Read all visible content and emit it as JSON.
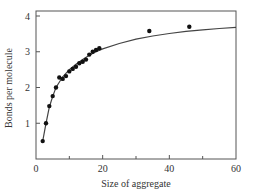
{
  "chart_data": {
    "type": "scatter",
    "title": "",
    "xlabel": "Size of aggregate",
    "ylabel": "Bonds per molecule",
    "xlim": [
      0,
      60
    ],
    "ylim": [
      0,
      4
    ],
    "x_ticks": [
      0,
      20,
      40,
      60
    ],
    "x_tick_labels": [
      "0",
      "20",
      "40",
      "60"
    ],
    "x_minor_ticks": [
      10,
      30,
      50
    ],
    "y_ticks": [
      1,
      2,
      3,
      4
    ],
    "y_tick_labels": [
      "1",
      "2",
      "3",
      "4"
    ],
    "grid": false,
    "legend": null,
    "series": [
      {
        "name": "data",
        "kind": "scatter",
        "marker": "filled-circle",
        "color": "#111111",
        "points": [
          [
            2,
            0.5
          ],
          [
            3,
            1.0
          ],
          [
            4,
            1.48
          ],
          [
            5,
            1.76
          ],
          [
            6,
            2.0
          ],
          [
            7,
            2.28
          ],
          [
            8,
            2.24
          ],
          [
            9,
            2.32
          ],
          [
            10,
            2.45
          ],
          [
            11,
            2.52
          ],
          [
            12,
            2.58
          ],
          [
            13,
            2.68
          ],
          [
            14,
            2.72
          ],
          [
            15,
            2.78
          ],
          [
            16,
            2.92
          ],
          [
            17,
            3.0
          ],
          [
            18,
            3.05
          ],
          [
            19,
            3.1
          ],
          [
            34,
            3.58
          ],
          [
            46,
            3.7
          ]
        ]
      },
      {
        "name": "fit",
        "kind": "line",
        "color": "#444444",
        "points": [
          [
            2,
            0.5
          ],
          [
            3,
            1.0
          ],
          [
            4,
            1.45
          ],
          [
            5,
            1.75
          ],
          [
            6,
            2.0
          ],
          [
            8,
            2.3
          ],
          [
            10,
            2.5
          ],
          [
            12,
            2.65
          ],
          [
            14,
            2.78
          ],
          [
            16,
            2.9
          ],
          [
            18,
            3.0
          ],
          [
            20,
            3.08
          ],
          [
            25,
            3.23
          ],
          [
            30,
            3.35
          ],
          [
            35,
            3.44
          ],
          [
            40,
            3.51
          ],
          [
            45,
            3.57
          ],
          [
            50,
            3.61
          ],
          [
            55,
            3.65
          ],
          [
            60,
            3.68
          ]
        ]
      }
    ]
  }
}
